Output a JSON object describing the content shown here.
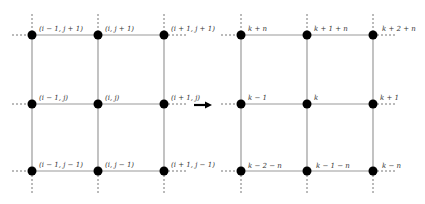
{
  "diagram": {
    "left_grid": {
      "labels": {
        "r0c0": "(i − 1, j + 1)",
        "r0c1": "(i, j + 1)",
        "r0c2": "(i + 1, j + 1)",
        "r1c0": "(i − 1, j)",
        "r1c1": "(i, j)",
        "r1c2": "(i + 1, j)",
        "r2c0": "(i − 1, j − 1)",
        "r2c1": "(i, j − 1)",
        "r2c2": "(i + 1, j − 1)"
      }
    },
    "right_grid": {
      "labels": {
        "r0c0": "k + n",
        "r0c1": "k + 1 + n",
        "r0c2": "k + 2 + n",
        "r1c0": "k − 1",
        "r1c1": "k",
        "r1c2": "k + 1",
        "r2c0": "k − 2 − n",
        "r2c1": "k − 1 − n",
        "r2c2": "k − n"
      }
    },
    "arrow": "mapping-arrow"
  }
}
